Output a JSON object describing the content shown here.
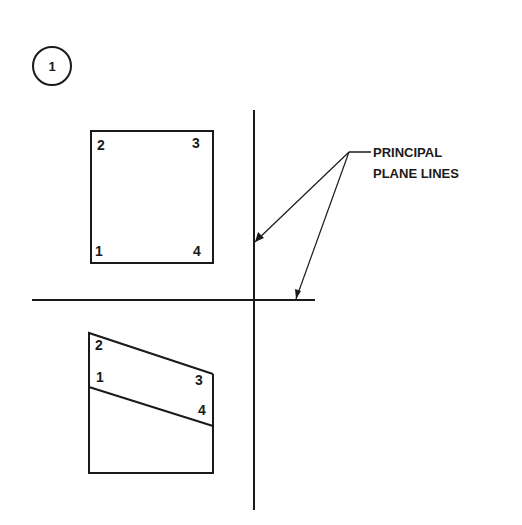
{
  "figure": {
    "step_number": "1",
    "callout_label_line1": "PRINCIPAL",
    "callout_label_line2": "PLANE LINES",
    "top_view": {
      "corner_labels": {
        "top_left": "2",
        "top_right": "3",
        "bottom_left": "1",
        "bottom_right": "4"
      }
    },
    "front_view": {
      "corner_labels": {
        "upper_left": "2",
        "mid_left": "1",
        "upper_right": "3",
        "mid_right": "4"
      }
    }
  },
  "colors": {
    "line": "#1a1a1a",
    "background": "#ffffff"
  }
}
